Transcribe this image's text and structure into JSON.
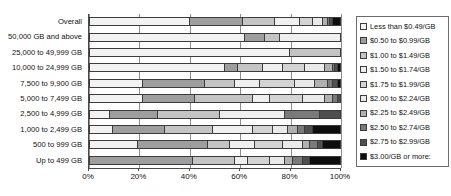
{
  "chart_data": {
    "type": "bar",
    "subtype": "100%-stacked-horizontal-bar",
    "title": "",
    "subtitle": "",
    "xlabel": "",
    "ylabel": "",
    "xlim": [
      0,
      100
    ],
    "xticks": [
      0,
      20,
      40,
      60,
      80,
      100
    ],
    "xtick_labels": [
      "0%",
      "20%",
      "40%",
      "60%",
      "80%",
      "100%"
    ],
    "grid": true,
    "grid_axis": "x",
    "legend_position": "right",
    "categories": [
      "Overall",
      "50,000 GB and above",
      "25,000 to 49,999 GB",
      "10,000 to 24,999 GB",
      "7,500 to 9,900 GB",
      "5,000 to 7,499 GB",
      "2,500 to 4,999 GB",
      "1,000 to 2,499 GB",
      "500 to 999 GB",
      "Up to 499 GB"
    ],
    "series": [
      {
        "name": "Less than $0.49/GB",
        "color": "#f2f2f2",
        "values": [
          40,
          62,
          80,
          54,
          21,
          21,
          8,
          9,
          19,
          0
        ]
      },
      {
        "name": "$0.50 to $0.99/GB",
        "color": "#9e9e9e",
        "values": [
          21,
          8,
          0,
          5,
          25,
          21,
          19,
          21,
          28,
          41
        ]
      },
      {
        "name": "$1.00 to $1.49/GB",
        "color": "#c4c4c4",
        "values": [
          13,
          6,
          20,
          10,
          12,
          23,
          25,
          19,
          9,
          17
        ]
      },
      {
        "name": "$1.50 to $1.74/GB",
        "color": "#efefef",
        "values": [
          10,
          24,
          0,
          8,
          10,
          7,
          26,
          16,
          10,
          5
        ]
      },
      {
        "name": "$1.75 to $1.99/GB",
        "color": "#d4d4d4",
        "values": [
          5,
          0,
          0,
          9,
          14,
          13,
          0,
          8,
          11,
          9
        ]
      },
      {
        "name": "$2.00 to $2.24/GB",
        "color": "#eaeaea",
        "values": [
          4,
          0,
          0,
          8,
          8,
          9,
          0,
          6,
          8,
          6
        ]
      },
      {
        "name": "$2.25 to $2.49/GB",
        "color": "#b0b0b0",
        "values": [
          2,
          0,
          0,
          3,
          5,
          3,
          0,
          4,
          3,
          3
        ]
      },
      {
        "name": "$2.50 to $2.74/GB",
        "color": "#7a7a7a",
        "values": [
          1,
          0,
          0,
          1,
          2,
          2,
          14,
          3,
          3,
          4
        ]
      },
      {
        "name": "$2.75 to $2.99/GB",
        "color": "#4f4f4f",
        "values": [
          1,
          0,
          0,
          1,
          2,
          1,
          8,
          3,
          2,
          3
        ]
      },
      {
        "name": "$3.00/GB or more:",
        "color": "#0d0d0d",
        "values": [
          3,
          0,
          0,
          1,
          1,
          0,
          0,
          11,
          7,
          12
        ]
      }
    ]
  },
  "legend": {
    "items": [
      {
        "label": "Less than $0.49/GB",
        "color": "#f2f2f2"
      },
      {
        "label": "$0.50 to $0.99/GB",
        "color": "#9e9e9e"
      },
      {
        "label": "$1.00 to $1.49/GB",
        "color": "#c4c4c4"
      },
      {
        "label": "$1.50 to $1.74/GB",
        "color": "#efefef"
      },
      {
        "label": "$1.75 to $1.99/GB",
        "color": "#d4d4d4"
      },
      {
        "label": "$2.00 to $2.24/GB",
        "color": "#eaeaea"
      },
      {
        "label": "$2.25 to $2.49/GB",
        "color": "#b0b0b0"
      },
      {
        "label": "$2.50 to $2.74/GB",
        "color": "#7a7a7a"
      },
      {
        "label": "$2.75 to $2.99/GB",
        "color": "#4f4f4f"
      },
      {
        "label": "$3.00/GB or more:",
        "color": "#0d0d0d"
      }
    ]
  },
  "colors": {
    "axis": "#4a4a4a",
    "gridline": "#8d8d8d",
    "bar_outline": "#3c3c3c",
    "text": "#111111",
    "background": "#ffffff",
    "legend_border": "#6b6b6b"
  }
}
